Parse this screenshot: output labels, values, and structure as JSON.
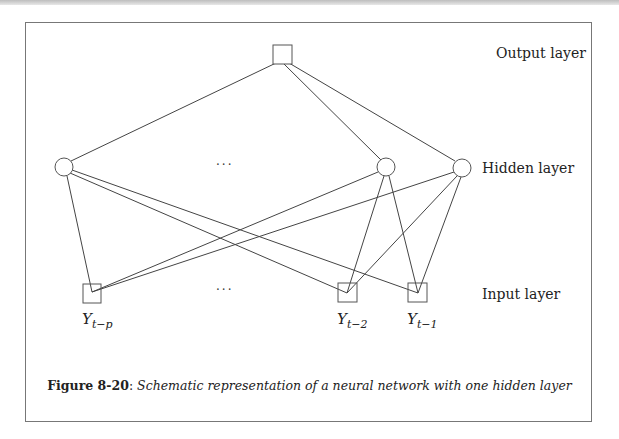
{
  "figure": {
    "layers": {
      "output": "Output layer",
      "hidden": "Hidden layer",
      "input": "Input layer"
    },
    "ellipsis": "···",
    "inputs": [
      {
        "base": "Y",
        "sub": "t−p"
      },
      {
        "base": "Y",
        "sub": "t−2"
      },
      {
        "base": "Y",
        "sub": "t−1"
      }
    ],
    "caption": {
      "label": "Figure 8-20",
      "separator": ": ",
      "text": "Schematic representation of a neural network with one hidden layer"
    },
    "colors": {
      "line": "#444444",
      "frame": "#777777",
      "background": "#ffffff"
    }
  }
}
